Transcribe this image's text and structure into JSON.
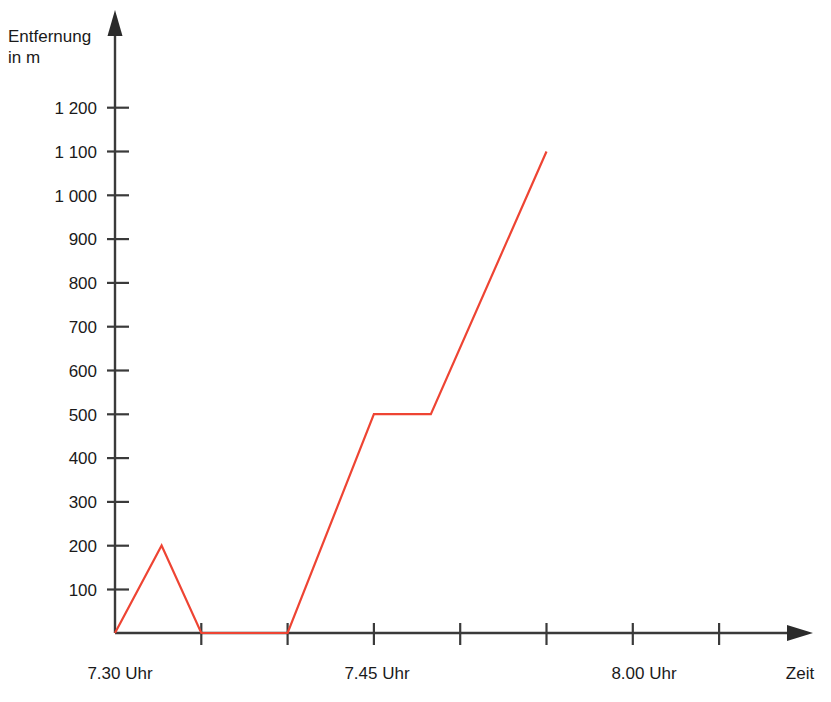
{
  "chart_data": {
    "type": "line",
    "title": "",
    "subtitle": "",
    "xlabel": "Zeit",
    "ylabel_line1": "Entfernung",
    "ylabel_line2": "in m",
    "series": [
      {
        "name": "Entfernung",
        "color": "#ee4433",
        "x": [
          "7.30",
          "7.32:40",
          "7.35",
          "7.40",
          "7.45",
          "7.48:20",
          "7.55"
        ],
        "x_minutes": [
          0,
          2.7,
          5,
          10,
          15,
          18.3,
          25
        ],
        "values": [
          0,
          200,
          0,
          0,
          500,
          500,
          1100
        ]
      }
    ],
    "y_ticks": [
      100,
      200,
      300,
      400,
      500,
      600,
      700,
      800,
      900,
      1000,
      1100,
      1200
    ],
    "y_tick_labels": [
      "100",
      "200",
      "300",
      "400",
      "500",
      "600",
      "700",
      "800",
      "900",
      "1 000",
      "1 100",
      "1 200"
    ],
    "ylim": [
      0,
      1285
    ],
    "x_tick_minutes": [
      5,
      10,
      15,
      20,
      25,
      30,
      35
    ],
    "x_labels": [
      {
        "text": "7.30 Uhr",
        "minutes": 0
      },
      {
        "text": "7.45 Uhr",
        "minutes": 15
      },
      {
        "text": "8.00 Uhr",
        "minutes": 30
      }
    ],
    "xlim_minutes": [
      0,
      40
    ],
    "grid": false,
    "legend": false,
    "axis_color": "#3a3a3a"
  },
  "labels": {
    "y_axis_title_line1": "Entfernung",
    "y_axis_title_line2": "in m",
    "x_axis_title": "Zeit",
    "x_tick_0": "7.30 Uhr",
    "x_tick_1": "7.45 Uhr",
    "x_tick_2": "8.00 Uhr",
    "y_tick_100": "100",
    "y_tick_200": "200",
    "y_tick_300": "300",
    "y_tick_400": "400",
    "y_tick_500": "500",
    "y_tick_600": "600",
    "y_tick_700": "700",
    "y_tick_800": "800",
    "y_tick_900": "900",
    "y_tick_1000": "1 000",
    "y_tick_1100": "1 100",
    "y_tick_1200": "1 200"
  }
}
